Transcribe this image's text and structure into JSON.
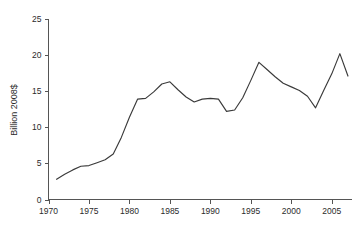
{
  "chart_data": {
    "type": "line",
    "title": "",
    "subtitle": "",
    "xlabel": "",
    "ylabel": "Billion 2008$",
    "xlim": [
      1970,
      2007.5
    ],
    "ylim": [
      0,
      25
    ],
    "grid": false,
    "legend": null,
    "xticks": [
      1970,
      1975,
      1980,
      1985,
      1990,
      1995,
      2000,
      2005
    ],
    "xtick_labels": [
      "1970",
      "1975",
      "1980",
      "1985",
      "1990",
      "1995",
      "2000",
      "2005"
    ],
    "yticks": [
      0,
      5,
      10,
      15,
      20,
      25
    ],
    "ytick_labels": [
      "0",
      "5",
      "10",
      "15",
      "20",
      "25"
    ],
    "series": [
      {
        "name": "Billion 2008$",
        "color": "#3a3a3a",
        "x": [
          1971,
          1972,
          1973,
          1974,
          1975,
          1976,
          1977,
          1978,
          1979,
          1980,
          1981,
          1982,
          1983,
          1984,
          1985,
          1986,
          1987,
          1988,
          1989,
          1990,
          1991,
          1992,
          1993,
          1994,
          1995,
          1996,
          1997,
          1998,
          1999,
          2000,
          2001,
          2002,
          2003,
          2004,
          2005,
          2006,
          2007
        ],
        "values": [
          2.8,
          3.5,
          4.1,
          4.6,
          4.7,
          5.1,
          5.5,
          6.3,
          8.6,
          11.4,
          13.9,
          14.0,
          14.9,
          16.0,
          16.3,
          15.2,
          14.2,
          13.5,
          13.9,
          14.0,
          13.9,
          12.2,
          12.4,
          14.1,
          16.5,
          19.0,
          18.0,
          17.0,
          16.1,
          15.6,
          15.1,
          14.3,
          12.7,
          15.1,
          17.4,
          20.2,
          17.1
        ]
      }
    ]
  },
  "axes": {
    "y_title": "Billion 2008$"
  }
}
